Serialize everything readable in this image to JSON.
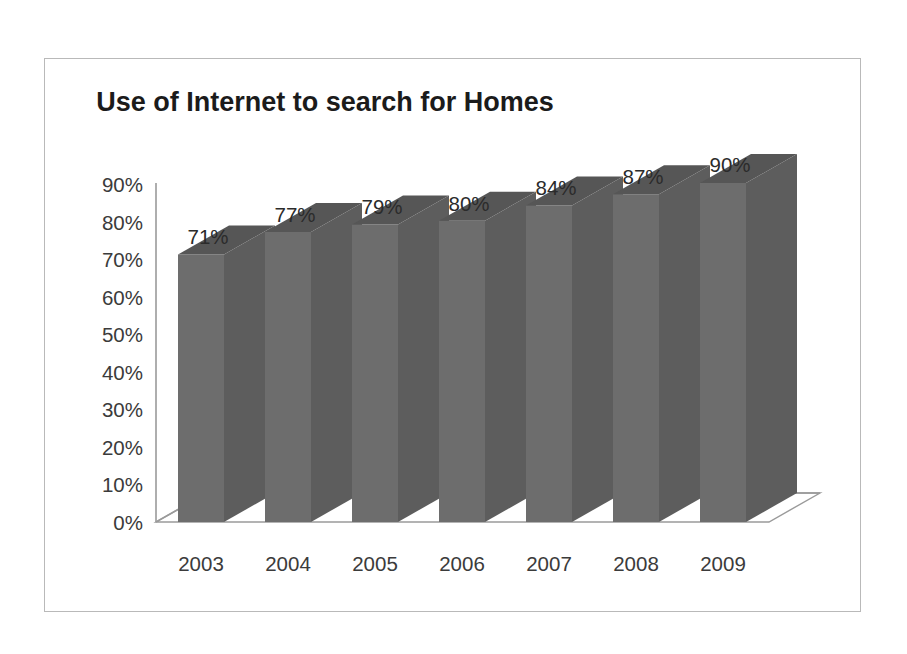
{
  "chart_data": {
    "type": "bar",
    "title": "Use of Internet to search for Homes",
    "xlabel": "",
    "ylabel": "",
    "categories": [
      "2003",
      "2004",
      "2005",
      "2006",
      "2007",
      "2008",
      "2009"
    ],
    "values": [
      71,
      77,
      79,
      80,
      84,
      87,
      90
    ],
    "value_labels": [
      "71%",
      "77%",
      "79%",
      "80%",
      "84%",
      "87%",
      "90%"
    ],
    "ytick_labels": [
      "0%",
      "10%",
      "20%",
      "30%",
      "40%",
      "50%",
      "60%",
      "70%",
      "80%",
      "90%"
    ],
    "ytick_values": [
      0,
      10,
      20,
      30,
      40,
      50,
      60,
      70,
      80,
      90
    ],
    "ylim": [
      0,
      90
    ],
    "grid": false,
    "legend": false,
    "legend_position": "none",
    "style": "3d-column",
    "colors": {
      "bar_front": "#6d6d6d",
      "bar_side": "#5d5d5d",
      "bar_top": "#565656",
      "axis": "#9a9a9a",
      "floor": "#ffffff",
      "title_text": "#1b1b1b",
      "tick_text": "#3b3b3b",
      "frame_border": "#b9b9b9",
      "background": "#ffffff"
    }
  }
}
